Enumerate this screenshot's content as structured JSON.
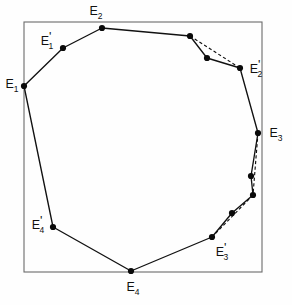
{
  "figure": {
    "background_color": "#fefefe",
    "line_color": "#111111",
    "frame_color": "#6b6b6b",
    "frame": {
      "x": 24,
      "y": 22,
      "width": 238,
      "height": 250
    },
    "labels": [
      {
        "id": "E2",
        "base": "E",
        "sub": "2",
        "prime": "",
        "x": 96,
        "y": 12,
        "anchor": "middle"
      },
      {
        "id": "E1prime",
        "base": "E",
        "sub": "1",
        "prime": "'",
        "x": 47,
        "y": 42,
        "anchor": "middle"
      },
      {
        "id": "E1",
        "base": "E",
        "sub": "1",
        "prime": "",
        "x": 12,
        "y": 85,
        "anchor": "middle"
      },
      {
        "id": "E2prime",
        "base": "E",
        "sub": "2",
        "prime": "'",
        "x": 256,
        "y": 70,
        "anchor": "middle"
      },
      {
        "id": "E3",
        "base": "E",
        "sub": "3",
        "prime": "",
        "x": 276,
        "y": 134,
        "anchor": "middle"
      },
      {
        "id": "E3prime",
        "base": "E",
        "sub": "3",
        "prime": "'",
        "x": 222,
        "y": 253,
        "anchor": "middle"
      },
      {
        "id": "E4prime",
        "base": "E",
        "sub": "4",
        "prime": "'",
        "x": 38,
        "y": 226,
        "anchor": "middle"
      },
      {
        "id": "E4",
        "base": "E",
        "sub": "4",
        "prime": "",
        "x": 133,
        "y": 288,
        "anchor": "middle"
      }
    ],
    "vertices": [
      {
        "id": "E2",
        "x": 102,
        "y": 28,
        "r": 3.1
      },
      {
        "id": "v-top-r",
        "x": 190,
        "y": 36,
        "r": 3.1
      },
      {
        "id": "v-mid-r",
        "x": 207,
        "y": 58,
        "r": 3.1
      },
      {
        "id": "E2prime",
        "x": 240,
        "y": 68,
        "r": 3.1
      },
      {
        "id": "E3",
        "x": 258,
        "y": 133,
        "r": 3.1
      },
      {
        "id": "v-r-1",
        "x": 251,
        "y": 176,
        "r": 3.1
      },
      {
        "id": "v-r-2",
        "x": 253,
        "y": 195,
        "r": 3.1
      },
      {
        "id": "v-r-3",
        "x": 232,
        "y": 213,
        "r": 3.1
      },
      {
        "id": "E3prime",
        "x": 212,
        "y": 237,
        "r": 3.1
      },
      {
        "id": "E4",
        "x": 131,
        "y": 271,
        "r": 3.1
      },
      {
        "id": "E4prime",
        "x": 53,
        "y": 227,
        "r": 3.1
      },
      {
        "id": "E1",
        "x": 24,
        "y": 86,
        "r": 3.1
      },
      {
        "id": "E1prime",
        "x": 63,
        "y": 48,
        "r": 3.1
      }
    ],
    "polygon_path": "M 102,28 L 190,36 L 207,58 L 240,68 L 258,133 L 251,176 L 253,195 L 232,213 L 212,237 L 131,271 L 53,227 L 24,86 L 63,48 Z",
    "chords": [
      {
        "id": "chord-e2prime",
        "x1": 190,
        "y1": 36,
        "x2": 240,
        "y2": 68
      },
      {
        "id": "chord-e3-down",
        "x1": 258,
        "y1": 133,
        "x2": 253,
        "y2": 195
      },
      {
        "id": "chord-e3prime",
        "x1": 253,
        "y1": 195,
        "x2": 212,
        "y2": 237
      }
    ],
    "caption": ""
  }
}
